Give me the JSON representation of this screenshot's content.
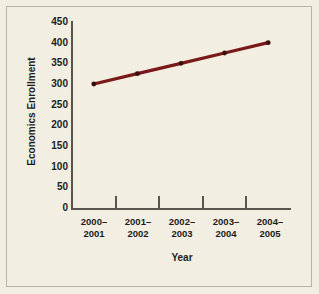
{
  "chart_data": {
    "type": "line",
    "title": "",
    "xlabel": "Year",
    "ylabel": "Economics Enrollment",
    "categories": [
      "2000–\n2001",
      "2001–\n2002",
      "2002–\n2003",
      "2003–\n2004",
      "2004–\n2005"
    ],
    "category_lines": [
      [
        "2000–",
        "2001"
      ],
      [
        "2001–",
        "2002"
      ],
      [
        "2002–",
        "2003"
      ],
      [
        "2003–",
        "2004"
      ],
      [
        "2004–",
        "2005"
      ]
    ],
    "values": [
      300,
      325,
      350,
      375,
      400
    ],
    "series": [
      {
        "name": "Economics Enrollment",
        "values": [
          300,
          325,
          350,
          375,
          400
        ]
      }
    ],
    "ylim": [
      0,
      450
    ],
    "yticks": [
      0,
      50,
      100,
      150,
      200,
      250,
      300,
      350,
      400,
      450
    ],
    "ytick_labels": [
      "0",
      "50",
      "100",
      "150",
      "200",
      "250",
      "300",
      "350",
      "400",
      "450"
    ],
    "grid": false,
    "legend": false,
    "legend_position": "none",
    "marker": "circle",
    "colors": {
      "line": "#7a1a18",
      "marker": "#3a0f0d",
      "axis": "#58564c",
      "background": "#f2efe2",
      "frame": "#b9b5a2",
      "text": "#1c1c1c"
    }
  }
}
